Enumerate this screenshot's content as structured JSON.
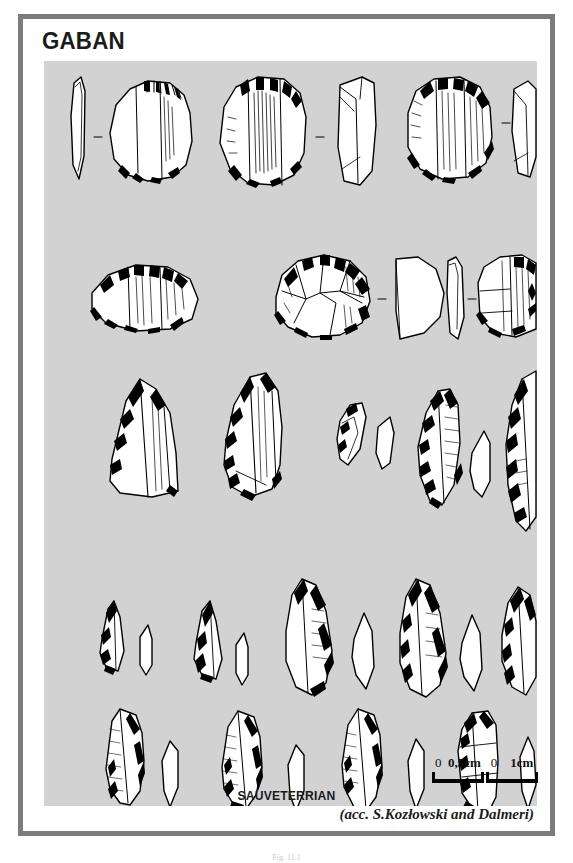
{
  "plate": {
    "title": "GABAN",
    "culture_label": "SAUVETERRIAN",
    "credit": "(acc. S.Kozłowski and Dalmeri)",
    "figure_caption": "Fig. 11.1",
    "panel_background": "#d2d2d2",
    "frame_color": "#7c7c7c",
    "ink_color": "#000000"
  },
  "scales": [
    {
      "zero": "0",
      "label": "0,5cm",
      "bar_px": 52
    },
    {
      "zero": "0",
      "label": "1cm",
      "bar_px": 52
    }
  ],
  "artifact_rows": [
    {
      "row": 1,
      "description": "Endscrapers on flakes, plan views with side profiles",
      "items": [
        "profile-blade",
        "endscraper-plan",
        "endscraper-plan-large",
        "profile-flake",
        "endscraper-plan-round",
        "profile-flake"
      ]
    },
    {
      "row": 2,
      "description": "Round and short scrapers with profiles",
      "items": [
        "round-scraper",
        "circular-scraper",
        "profile-domed",
        "profile-thin",
        "short-scraper"
      ]
    },
    {
      "row": 3,
      "description": "Points, backed bladelets and crescents with cross-sections",
      "items": [
        "truncated-point",
        "leaf-point",
        "small-crescent",
        "profile-sliver",
        "backed-crescent",
        "profile-sliver",
        "large-backed-point",
        "profile-sliver"
      ]
    },
    {
      "row": 4,
      "description": "Small triangular microliths paired with profiles",
      "items": [
        "micro-triangle",
        "profile-tiny",
        "micro-triangle",
        "profile-tiny",
        "backed-point",
        "profile-leaf",
        "backed-point",
        "profile-leaf",
        "backed-point",
        "profile-leaf"
      ]
    },
    {
      "row": 5,
      "description": "Elongated Sauveterre points and backed bladelets with profiles",
      "items": [
        "sauveterre-point",
        "profile-narrow",
        "sauveterre-point",
        "profile-narrow",
        "sauveterre-point",
        "profile-narrow",
        "backed-bladelet",
        "profile-narrow",
        "truncated-bladelet",
        "profile-narrow"
      ]
    }
  ]
}
